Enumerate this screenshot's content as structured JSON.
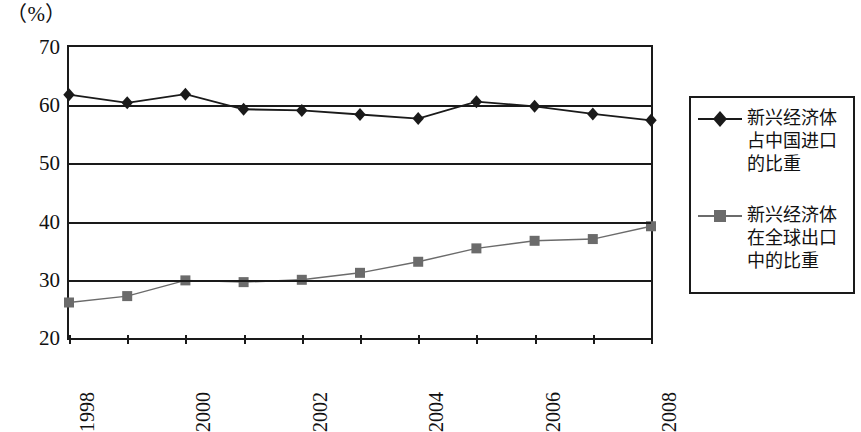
{
  "chart_data": {
    "type": "line",
    "title": "",
    "subtitle": "",
    "unit_label": "（%）",
    "xlabel": "",
    "ylabel": "",
    "x": [
      1998,
      1999,
      2000,
      2001,
      2002,
      2003,
      2004,
      2005,
      2006,
      2007,
      2008
    ],
    "x_tick_labels": [
      "1998",
      "",
      "2000",
      "",
      "2002",
      "",
      "2004",
      "",
      "2006",
      "",
      "2008"
    ],
    "x_tick_labels_visible": [
      "1998",
      "2000",
      "2002",
      "2004",
      "2006",
      "2008"
    ],
    "y_tick_labels": [
      "70",
      "60",
      "50",
      "40",
      "30",
      "20"
    ],
    "y_ticks": [
      70,
      60,
      50,
      40,
      30,
      20
    ],
    "ylim": [
      20,
      70
    ],
    "xlim": [
      1998,
      2008
    ],
    "grid": "horizontal",
    "legend_position": "right-outside",
    "series": [
      {
        "name": "新兴经济体占中国进口的比重",
        "marker": "diamond",
        "color": "#1a1a1a",
        "values": [
          61.8,
          60.4,
          61.9,
          59.3,
          59.1,
          58.4,
          57.7,
          60.6,
          59.8,
          58.5,
          57.4
        ]
      },
      {
        "name": "新兴经济体在全球出口中的比重",
        "marker": "square",
        "color": "#6b6b6b",
        "values": [
          26.1,
          27.2,
          29.9,
          29.6,
          30.0,
          31.2,
          33.1,
          35.4,
          36.7,
          37.0,
          39.2
        ]
      }
    ]
  },
  "legend": {
    "entries": [
      {
        "label": "新兴经济体\n占中国进口\n的比重",
        "marker": "diamond",
        "color": "#1a1a1a"
      },
      {
        "label": "新兴经济体\n在全球出口\n中的比重",
        "marker": "square",
        "color": "#6b6b6b"
      }
    ]
  },
  "colors": {
    "axis": "#1a1a1a",
    "series_1": "#1a1a1a",
    "series_2": "#6b6b6b",
    "background": "#ffffff"
  }
}
